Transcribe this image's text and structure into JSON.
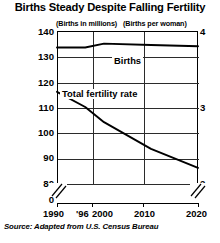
{
  "chart_data": {
    "type": "line",
    "title": "Births Steady Despite Falling Fertility",
    "source": "Source: Adapted from U.S. Census Bureau",
    "xlabel": "",
    "x_tick_labels": [
      "1990",
      "'96",
      "2000",
      "2010",
      "2020"
    ],
    "x_tick_values": [
      1990,
      1996,
      2000,
      2010,
      2020
    ],
    "xlim": [
      1990,
      2020
    ],
    "grid": true,
    "gridlines_vertical_at": [
      2000,
      2010
    ],
    "legend_position": "inline-labels",
    "axes": [
      {
        "side": "left",
        "caption": "(Births in millions)",
        "ylabel": "Births in millions",
        "ticks": [
          "140",
          "130",
          "120",
          "110",
          "100",
          "90",
          "80"
        ],
        "tick_values": [
          140,
          130,
          120,
          110,
          100,
          90,
          80
        ],
        "ylim": [
          80,
          140
        ],
        "axis_break": true,
        "zero_label": "0"
      },
      {
        "side": "right",
        "caption": "(Births per woman)",
        "ylabel": "Births per woman",
        "ticks": [
          "4",
          "3",
          "2"
        ],
        "tick_values": [
          4,
          3,
          2
        ],
        "ylim": [
          2,
          4
        ],
        "axis_break": true
      }
    ],
    "series": [
      {
        "name": "Births",
        "label": "Births",
        "axis": "left",
        "units": "millions",
        "x": [
          1990,
          1996,
          2000,
          2010,
          2020
        ],
        "values": [
          133.5,
          133.5,
          135.0,
          134.5,
          134.0
        ]
      },
      {
        "name": "Total fertility rate",
        "label": "Total fertility rate",
        "axis": "right",
        "units": "births per woman",
        "x": [
          1990,
          1996,
          2000,
          2010,
          2020
        ],
        "values": [
          3.2,
          3.0,
          2.8,
          2.45,
          2.2
        ]
      }
    ]
  },
  "style": {
    "line_color": "#000000",
    "grid_color": "#2b2b2b",
    "background": "#ffffff"
  }
}
